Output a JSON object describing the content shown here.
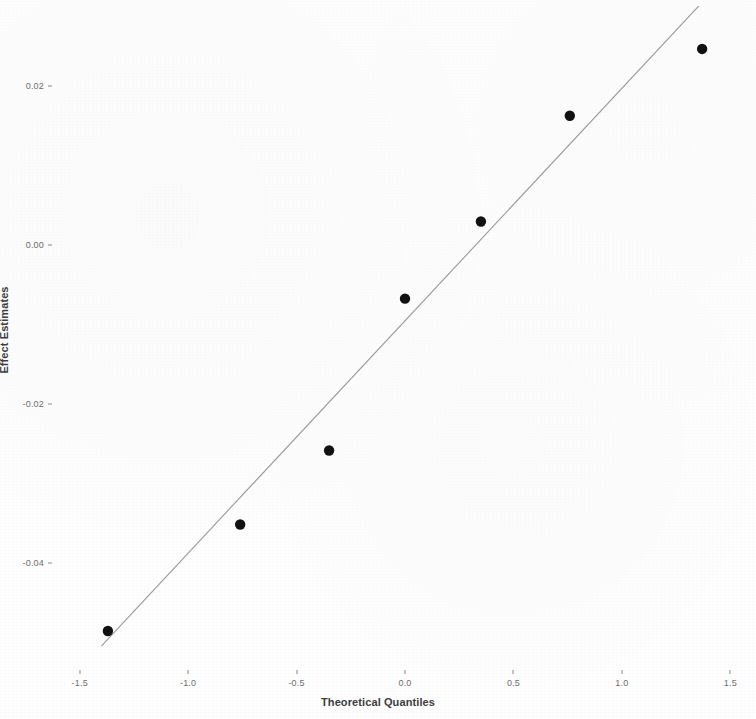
{
  "chart_data": {
    "type": "scatter",
    "title": "",
    "xlabel": "Theoretical Quantiles",
    "ylabel": "Effect Estimates",
    "xlim": [
      -1.6,
      1.6
    ],
    "ylim": [
      -0.053,
      0.03
    ],
    "grid": false,
    "legend": null,
    "xticks": [
      -1.5,
      -1.0,
      -0.5,
      0.0,
      0.5,
      1.0,
      1.5
    ],
    "xtick_labels": [
      "-1.5",
      "-1.0",
      "-0.5",
      "0.0",
      "0.5",
      "1.0",
      "1.5"
    ],
    "yticks": [
      0.02,
      0.0,
      -0.02,
      -0.04
    ],
    "ytick_labels": [
      "0.02",
      "0.00",
      "-0.02",
      "-0.04"
    ],
    "point_color": "#111111",
    "line_color": "#9a9a9a",
    "background_color": "#fefefe",
    "x": [
      -1.37,
      -0.76,
      -0.35,
      0.0,
      0.35,
      0.76,
      1.37
    ],
    "y": [
      -0.0486,
      -0.0352,
      -0.0259,
      -0.0068,
      0.0029,
      0.0162,
      0.0246
    ],
    "reference_line": {
      "type": "qq-line",
      "x_start": -1.4,
      "y_start": -0.0505,
      "x_end": 1.44,
      "y_end": 0.0325
    },
    "annotations": []
  },
  "axes": {
    "y_title": "Effect Estimates",
    "x_title": "Theoretical Quantiles"
  }
}
